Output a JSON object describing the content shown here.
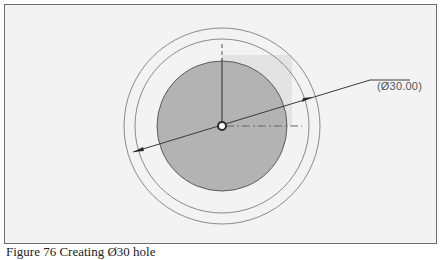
{
  "diagram": {
    "type": "cad-sketch",
    "colors": {
      "frame_border": "#6e6e6e",
      "background": "#f3f3f3",
      "disc_fill": "#b3b3b3",
      "disc_stroke": "#5a5a5a",
      "ring_stroke": "#8a8a8a",
      "dimension_line": "#3a3a3a",
      "highlight_rect": "#d9d9d9"
    },
    "center": {
      "x": 222,
      "y": 126
    },
    "circles": [
      {
        "name": "outer-ring",
        "r": 98
      },
      {
        "name": "inner-ring",
        "r": 87
      },
      {
        "name": "hole-disc",
        "r": 65,
        "filled": true
      }
    ],
    "dimension": {
      "label": "(Ø30.00)",
      "from": {
        "x": 133,
        "y": 152
      },
      "to": {
        "x": 313,
        "y": 97
      },
      "leader_end": {
        "x": 410,
        "y": 78
      }
    }
  },
  "caption": {
    "text": "Figure 76 Creating Ø30 hole"
  }
}
